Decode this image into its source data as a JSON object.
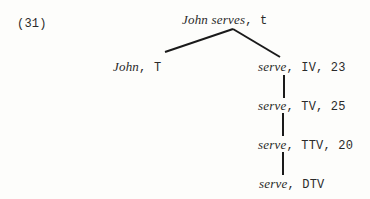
{
  "example_number": "(31)",
  "tree": {
    "root": {
      "expr": "John serves",
      "cat": ", t"
    },
    "left": {
      "expr": "John",
      "cat": ", T"
    },
    "right": [
      {
        "expr": "serve",
        "cat": ", IV, 23"
      },
      {
        "expr": "serve",
        "cat": ", TV, 25"
      },
      {
        "expr": "serve",
        "cat": ", TTV, 20"
      },
      {
        "expr": "serve",
        "cat": ", DTV"
      }
    ]
  },
  "colors": {
    "line": "#1a1a1a",
    "text": "#2a2a2a",
    "background": "#fdfdfb"
  }
}
